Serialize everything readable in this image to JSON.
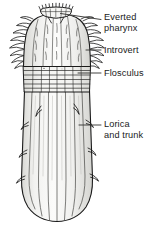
{
  "figure": {
    "name": "loriciferan-anatomy-diagram",
    "background_color": "#ffffff",
    "line_color": "#1a1a1a",
    "fill_color": "#f7f7f5",
    "shade_color": "#e3e3e0",
    "text_color": "#1a1a1a",
    "width": 155,
    "height": 229
  },
  "labels": [
    {
      "id": "everted-pharynx",
      "text": "Everted\npharynx",
      "leader": {
        "x1": 60.5,
        "y1": 13.5,
        "x2": 101,
        "y2": 19.5
      }
    },
    {
      "id": "introvert",
      "text": "Introvert",
      "leader": {
        "x1": 86,
        "y1": 50,
        "x2": 101,
        "y2": 50
      }
    },
    {
      "id": "flosculus",
      "text": "Flosculus",
      "leader": {
        "x1": 78,
        "y1": 73,
        "x2": 101,
        "y2": 73
      }
    },
    {
      "id": "lorica-and-trunk",
      "text": "Lorica\nand trunk",
      "leader": {
        "x1": 79,
        "y1": 125,
        "x2": 101,
        "y2": 125
      }
    }
  ],
  "anatomy": {
    "everted_pharynx": {
      "description": "small crowned toothed oral cone at the apex",
      "tooth_count": 11
    },
    "introvert": {
      "description": "spiny bulbous head region bearing rings of scalids",
      "scalid_rows": 4,
      "ridge_count": 6
    },
    "flosculus": {
      "description": "banded collar with grid of transverse plates",
      "band_count": 6
    },
    "lorica_and_trunk": {
      "description": "elongate ridged trunk case with lateral hook spines",
      "ridge_count": 8,
      "spine_count": 8
    }
  }
}
